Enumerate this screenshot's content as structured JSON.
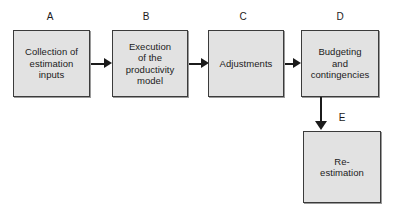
{
  "diagram": {
    "type": "flowchart",
    "orientation": "left-to-right with one downward branch",
    "colors": {
      "node_fill": "#e2e2e2",
      "node_border": "#3b3b3b",
      "arrow": "#1b1b1b",
      "background": "#ffffff",
      "text": "#1b1b1b"
    },
    "nodes": [
      {
        "id": "A",
        "tag": "A",
        "label": "Collection of\nestimation\ninputs"
      },
      {
        "id": "B",
        "tag": "B",
        "label": "Execution\nof the\nproductivity\nmodel"
      },
      {
        "id": "C",
        "tag": "C",
        "label": "Adjustments"
      },
      {
        "id": "D",
        "tag": "D",
        "label": "Budgeting\nand\ncontingencies"
      },
      {
        "id": "E",
        "tag": "E",
        "label": "Re-\nestimation"
      }
    ],
    "edges": [
      {
        "id": "A-B",
        "from": "A",
        "to": "B",
        "direction": "right"
      },
      {
        "id": "B-C",
        "from": "B",
        "to": "C",
        "direction": "right"
      },
      {
        "id": "C-D",
        "from": "C",
        "to": "D",
        "direction": "right"
      },
      {
        "id": "D-E",
        "from": "D",
        "to": "E",
        "direction": "down"
      }
    ]
  }
}
